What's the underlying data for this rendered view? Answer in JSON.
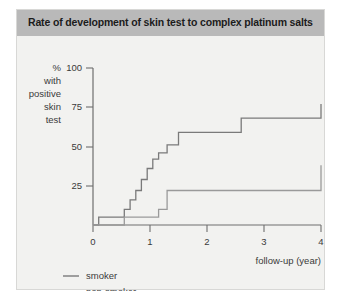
{
  "title": "Rate of development of skin test to complex platinum salts",
  "colors": {
    "panel_background": "#f2f2f0",
    "title_bar": "#b9b9b9",
    "title_text": "#1c1c1c",
    "axis": "#6e6e6e",
    "smoker_line": "#7a7a7a",
    "non_smoker_line": "#9a9a9a",
    "page_background": "#ffffff"
  },
  "y_axis_label_lines": [
    "%",
    "with",
    "positive",
    "skin",
    "test"
  ],
  "x_axis_caption": "follow-up (year)",
  "legend": {
    "position": "below-plot-left",
    "items": [
      {
        "label": "smoker",
        "key": "smoker"
      },
      {
        "label": "non-smoker",
        "key": "non_smoker"
      }
    ]
  },
  "chart_data": {
    "type": "line",
    "subtype": "step",
    "title": "Rate of development of skin test to complex platinum salts",
    "xlabel": "follow-up (year)",
    "ylabel": "% with positive skin test",
    "xlim": [
      0,
      4
    ],
    "ylim": [
      0,
      100
    ],
    "xticks": [
      0,
      1,
      2,
      3,
      4
    ],
    "yticks": [
      25,
      50,
      75,
      100
    ],
    "xtick_labels": [
      "0",
      "1",
      "2",
      "3",
      "4"
    ],
    "ytick_labels": [
      "25",
      "50",
      "75",
      "100"
    ],
    "grid": false,
    "legend_entries": [
      "smoker",
      "non-smoker"
    ],
    "series": [
      {
        "name": "smoker",
        "x": [
          0.0,
          0.1,
          0.4,
          0.55,
          0.65,
          0.75,
          0.85,
          0.95,
          1.05,
          1.15,
          1.3,
          1.5,
          2.6,
          4.0
        ],
        "y": [
          0,
          5,
          5,
          10,
          16,
          22,
          29,
          36,
          42,
          46,
          51,
          59,
          68,
          77
        ],
        "final_value": 77
      },
      {
        "name": "non-smoker",
        "x": [
          0.0,
          0.55,
          1.05,
          1.15,
          1.3,
          2.6,
          4.0
        ],
        "y": [
          0,
          5,
          5,
          10,
          22,
          22,
          38
        ],
        "final_value": 38
      }
    ]
  }
}
